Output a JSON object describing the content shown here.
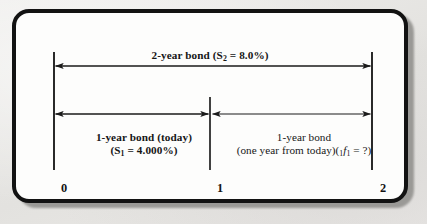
{
  "figure": {
    "type": "timeline-diagram",
    "title_top": "2-year bond (S2 = 8.0%)",
    "background_color": "#e9e9e7",
    "panel_color": "#fdfdfc",
    "border_color": "#121212",
    "line_color": "#1a1a1a"
  },
  "labels": {
    "top_bond": {
      "text_plain": "2-year bond (S2 = 8.0%)",
      "lead": "2-year bond (S",
      "sub": "2",
      "tail": " = 8.0%)"
    },
    "left_bond": {
      "line1": "1-year bond (today)",
      "line2_lead": "(S",
      "line2_sub": "1",
      "line2_tail": " = 4.000%)"
    },
    "right_bond": {
      "line1": "1-year bond",
      "line2_lead": "(one year from today)(",
      "line2_presub": "1",
      "line2_var": "f",
      "line2_sub": "1",
      "line2_tail": " = ?)"
    }
  },
  "axis": {
    "ticks": [
      {
        "label": "0",
        "position_px": 50
      },
      {
        "label": "1",
        "position_px": 206
      },
      {
        "label": "2",
        "position_px": 368
      }
    ]
  },
  "arrows": [
    {
      "name": "two-year-span",
      "from_tick": "0",
      "to_tick": "2",
      "double_headed": true,
      "y_px": 62
    },
    {
      "name": "first-year-span",
      "from_tick": "0",
      "to_tick": "1",
      "double_headed": true,
      "y_px": 110
    },
    {
      "name": "second-year-span",
      "from_tick": "1",
      "to_tick": "2",
      "double_headed": true,
      "y_px": 110
    }
  ],
  "verticals": [
    {
      "name": "tick-line-0",
      "x_px": 50,
      "y1_px": 48,
      "y2_px": 166
    },
    {
      "name": "tick-line-1",
      "x_px": 206,
      "y1_px": 93,
      "y2_px": 166
    },
    {
      "name": "tick-line-2",
      "x_px": 368,
      "y1_px": 48,
      "y2_px": 166
    }
  ]
}
